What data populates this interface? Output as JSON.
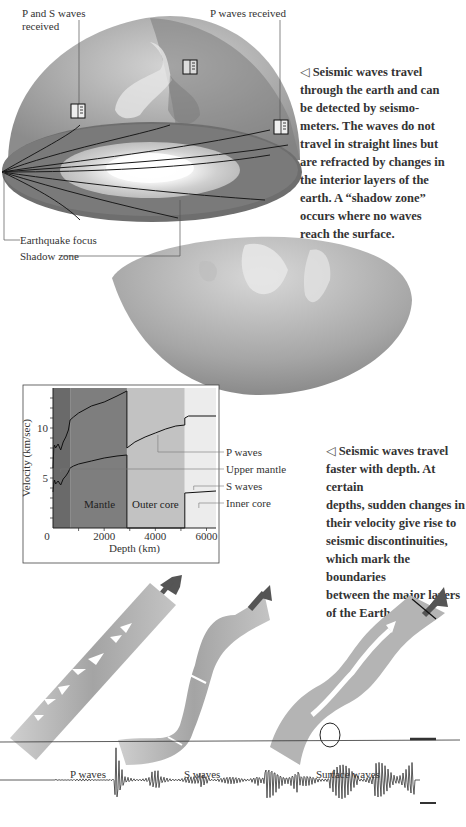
{
  "figure1": {
    "labels": {
      "p_and_s": [
        "P and S waves",
        "received"
      ],
      "p_only": "P waves received",
      "focus": "Earthquake focus",
      "shadow": "Shadow zone"
    },
    "caption": {
      "marker": "◁",
      "lines": [
        "Seismic waves travel",
        "through the earth and can",
        "be detected by seismo-",
        "meters. The waves do not",
        "travel in straight lines but",
        "are refracted by changes in",
        "the interior layers of the",
        "earth. A “shadow zone”",
        "occurs where no waves",
        "reach the surface."
      ]
    },
    "icons": [
      "seismometer-icon",
      "seismometer-icon",
      "seismometer-icon"
    ]
  },
  "chart_data": {
    "type": "line",
    "title": "",
    "xlabel": "Depth (km)",
    "ylabel": "Velocity (km/sec)",
    "xlim": [
      0,
      6371
    ],
    "ylim": [
      0,
      14
    ],
    "xticks": [
      "0",
      "2000",
      "4000",
      "6000"
    ],
    "yticks": [
      "5",
      "10"
    ],
    "regions": [
      {
        "name": "Upper mantle",
        "from": 0,
        "to": 670
      },
      {
        "name": "Mantle",
        "from": 670,
        "to": 2890
      },
      {
        "name": "Outer core",
        "from": 2890,
        "to": 5150
      },
      {
        "name": "Inner core",
        "from": 5150,
        "to": 6371
      }
    ],
    "region_labels": {
      "mantle": "Mantle",
      "outer_core": "Outer core"
    },
    "series": [
      {
        "name": "P waves",
        "x": [
          0,
          30,
          60,
          100,
          200,
          300,
          400,
          500,
          600,
          670,
          800,
          1000,
          1500,
          2000,
          2500,
          2890,
          2890,
          3200,
          3600,
          4000,
          4400,
          4800,
          5150,
          5150,
          5300,
          6371
        ],
        "y": [
          6.0,
          8.0,
          8.3,
          8.0,
          8.4,
          7.8,
          8.6,
          9.1,
          9.8,
          10.8,
          11.1,
          11.5,
          12.2,
          12.6,
          13.2,
          13.7,
          8.0,
          8.6,
          9.1,
          9.5,
          9.9,
          10.2,
          10.3,
          11.0,
          11.2,
          11.2
        ]
      },
      {
        "name": "S waves",
        "x": [
          0,
          30,
          60,
          100,
          200,
          300,
          400,
          500,
          600,
          670,
          800,
          1000,
          1500,
          2000,
          2500,
          2890,
          2890,
          5150,
          5150,
          6371
        ],
        "y": [
          3.6,
          4.5,
          4.8,
          4.4,
          4.7,
          4.3,
          4.9,
          5.2,
          5.6,
          6.0,
          6.2,
          6.4,
          6.7,
          7.0,
          7.2,
          7.3,
          0,
          0,
          3.5,
          3.7
        ]
      }
    ],
    "legend": [
      "P waves",
      "Upper mantle",
      "S waves",
      "Inner core"
    ],
    "grid": false
  },
  "figure2": {
    "caption": {
      "marker": "◁",
      "lines": [
        "Seismic waves travel",
        "faster with depth. At certain",
        "depths, sudden changes in",
        "their velocity give rise to",
        "seismic discontinuities,",
        "which mark the boundaries",
        "between the major layers",
        "of the Earth."
      ]
    }
  },
  "figure3": {
    "labels": {
      "p": "P waves",
      "s": "S waves",
      "surface": "Surface waves"
    }
  }
}
